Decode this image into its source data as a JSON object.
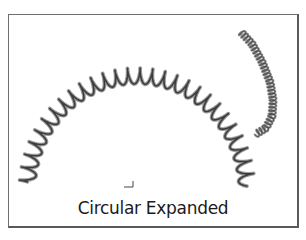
{
  "caption": "Circular Expanded",
  "colors": {
    "frame": "#6e6e6e",
    "spring_dark": "#3c3c3c",
    "spring_light": "#9a9a9a",
    "background": "#ffffff"
  },
  "large_spring": {
    "center_x": 137,
    "center_y": 192,
    "radius_x": 110,
    "radius_y": 116,
    "start_angle_deg": 184,
    "end_angle_deg": 356,
    "coils": 28,
    "amplitude": 8,
    "stroke_width": 2.6
  },
  "small_spring": {
    "points": [
      [
        241,
        32
      ],
      [
        252,
        44
      ],
      [
        262,
        62
      ],
      [
        270,
        82
      ],
      [
        273,
        100
      ],
      [
        272,
        116
      ],
      [
        266,
        128
      ],
      [
        256,
        134
      ]
    ],
    "coils": 34,
    "amplitude": 3.5,
    "stroke_width": 1.6
  },
  "axis_marker": {
    "x": 124,
    "y": 187
  }
}
